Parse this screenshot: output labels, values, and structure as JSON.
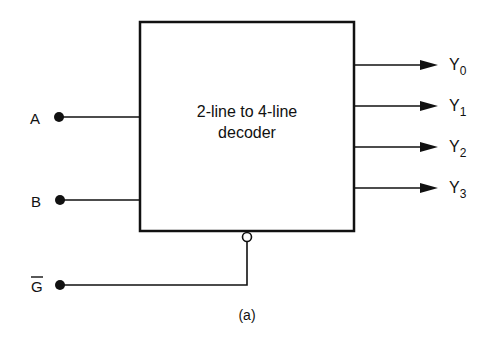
{
  "diagram": {
    "block": {
      "line1": "2-line to 4-line",
      "line2": "decoder"
    },
    "inputs": [
      {
        "name": "A",
        "overbar": false
      },
      {
        "name": "B",
        "overbar": false
      },
      {
        "name": "G",
        "overbar": true
      }
    ],
    "outputs": [
      {
        "base": "Y",
        "sub": "0"
      },
      {
        "base": "Y",
        "sub": "1"
      },
      {
        "base": "Y",
        "sub": "2"
      },
      {
        "base": "Y",
        "sub": "3"
      }
    ],
    "caption": "(a)",
    "colors": {
      "stroke": "#111111",
      "background": "#ffffff"
    }
  }
}
